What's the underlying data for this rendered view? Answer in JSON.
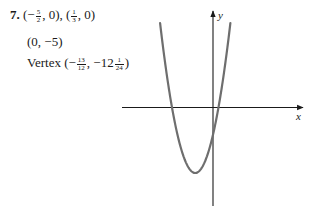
{
  "problem": {
    "number": "7.",
    "x_intercepts": {
      "prefix": "(",
      "first_sign": "−",
      "first_frac": {
        "num": "5",
        "den": "2"
      },
      "first_tail": ", 0), (",
      "second_frac": {
        "num": "1",
        "den": "3"
      },
      "second_tail": ", 0)"
    },
    "y_intercept": "(0, −5)",
    "vertex": {
      "label": "Vertex (−",
      "x_frac": {
        "num": "13",
        "den": "12"
      },
      "mid": ", −12",
      "y_frac": {
        "num": "1",
        "den": "24"
      },
      "tail": ")"
    }
  },
  "chart_data": {
    "type": "line",
    "title": "",
    "function": "y = 6x^2 + 13x - 5",
    "xlabel": "x",
    "ylabel": "y",
    "grid": false,
    "legend": null,
    "ticks": "none",
    "annotations": {
      "x_intercepts": [
        [
          -2.5,
          0
        ],
        [
          0.3333,
          0
        ]
      ],
      "y_intercept": [
        0,
        -5
      ],
      "vertex": [
        -1.0833,
        -12.0417
      ]
    },
    "xlim": [
      -5.6,
      5.5
    ],
    "ylim": [
      -18,
      17.5
    ],
    "series": [
      {
        "name": "parabola",
        "x": [
          -2.95,
          -2.75,
          -2.5,
          -2.25,
          -2.0,
          -1.75,
          -1.5,
          -1.25,
          -1.0833,
          -1.0,
          -0.75,
          -0.5,
          -0.25,
          0.0,
          0.25,
          0.3333,
          0.5,
          0.75,
          0.9
        ],
        "y": [
          8.87,
          5.63,
          0.0,
          -4.06,
          -7.0,
          -9.38,
          -11.0,
          -11.88,
          -12.04,
          -12.0,
          -11.38,
          -10.0,
          -7.88,
          -5.0,
          -1.38,
          0.0,
          3.0,
          8.13,
          10.56
        ]
      }
    ],
    "colors": {
      "curve": "#6e6e6e",
      "axes": "#1a1a1a"
    }
  }
}
